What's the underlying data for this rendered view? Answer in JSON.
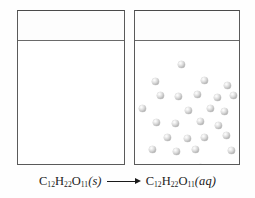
{
  "figure": {
    "background_color": "#ffffff",
    "outline_color": "#5a5a5a",
    "particle_color": "#b4b4b4"
  },
  "beakers": [
    {
      "id": "solid",
      "name": "beaker-with-solid-sucrose",
      "contents_state": "solid",
      "particle_count": 39,
      "has_water_line": true
    },
    {
      "id": "solution",
      "name": "beaker-with-aqueous-sucrose",
      "contents_state": "aqueous",
      "particle_count": 26,
      "has_water_line": true
    }
  ],
  "solid_lattice": {
    "rows": 7,
    "columns": 6,
    "arrangement": "staggered-close-packed"
  },
  "dissolved_particles": [
    {
      "x": 43,
      "y": 19
    },
    {
      "x": 17,
      "y": 36
    },
    {
      "x": 66,
      "y": 35
    },
    {
      "x": 89,
      "y": 40
    },
    {
      "x": 22,
      "y": 50
    },
    {
      "x": 40,
      "y": 51
    },
    {
      "x": 59,
      "y": 49
    },
    {
      "x": 79,
      "y": 52
    },
    {
      "x": 95,
      "y": 50
    },
    {
      "x": 4,
      "y": 63
    },
    {
      "x": 50,
      "y": 65
    },
    {
      "x": 72,
      "y": 63
    },
    {
      "x": 86,
      "y": 66
    },
    {
      "x": 18,
      "y": 77
    },
    {
      "x": 37,
      "y": 78
    },
    {
      "x": 62,
      "y": 76
    },
    {
      "x": 80,
      "y": 80
    },
    {
      "x": 29,
      "y": 92
    },
    {
      "x": 49,
      "y": 93
    },
    {
      "x": 66,
      "y": 92
    },
    {
      "x": 88,
      "y": 90
    },
    {
      "x": 14,
      "y": 104
    },
    {
      "x": 38,
      "y": 106
    },
    {
      "x": 57,
      "y": 104
    },
    {
      "x": 93,
      "y": 105
    },
    {
      "x": 62,
      "y": 122
    }
  ],
  "caption": {
    "name": "reaction-equation",
    "reactant": {
      "element_c": "C",
      "sub_c": "12",
      "element_h": "H",
      "sub_h": "22",
      "element_o": "O",
      "sub_o": "11",
      "state": "(s)"
    },
    "arrow": "⟶",
    "product": {
      "element_c": "C",
      "sub_c": "12",
      "element_h": "H",
      "sub_h": "22",
      "element_o": "O",
      "sub_o": "11",
      "state": "(aq)"
    },
    "full_text": "C12H22O11(s) ⟶ C12H22O11(aq)"
  }
}
